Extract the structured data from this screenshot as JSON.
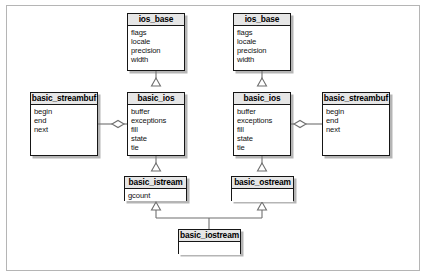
{
  "diagram": {
    "type": "uml-class-diagram",
    "background_color": "#ffffff",
    "frame_color": "#b5b5b5",
    "box_border_color": "#161616",
    "title_band_color": "#e6e6e6",
    "line_color": "#6f6f6f"
  },
  "classes": [
    {
      "id": "ios_base_left",
      "name": "ios_base",
      "attributes": [
        "flags",
        "locale",
        "precision",
        "width"
      ],
      "x": 127,
      "y": 13,
      "width": 58,
      "height": 58
    },
    {
      "id": "ios_base_right",
      "name": "ios_base",
      "attributes": [
        "flags",
        "locale",
        "precision",
        "width"
      ],
      "x": 233,
      "y": 13,
      "width": 58,
      "height": 58
    },
    {
      "id": "basic_streambuf_left",
      "name": "basic_streambuf",
      "attributes": [
        "begin",
        "end",
        "next"
      ],
      "x": 30,
      "y": 92,
      "width": 68,
      "height": 64
    },
    {
      "id": "basic_ios_left",
      "name": "basic_ios",
      "attributes": [
        "buffer",
        "exceptions",
        "fill",
        "state",
        "tie"
      ],
      "x": 127,
      "y": 92,
      "width": 58,
      "height": 64
    },
    {
      "id": "basic_ios_right",
      "name": "basic_ios",
      "attributes": [
        "buffer",
        "exceptions",
        "fill",
        "state",
        "tie"
      ],
      "x": 233,
      "y": 92,
      "width": 58,
      "height": 64
    },
    {
      "id": "basic_streambuf_right",
      "name": "basic_streambuf",
      "attributes": [
        "begin",
        "end",
        "next"
      ],
      "x": 322,
      "y": 92,
      "width": 68,
      "height": 64
    },
    {
      "id": "basic_istream",
      "name": "basic_istream",
      "attributes": [
        "gcount"
      ],
      "x": 124,
      "y": 176,
      "width": 63,
      "height": 25
    },
    {
      "id": "basic_ostream",
      "name": "basic_ostream",
      "attributes": [],
      "x": 231,
      "y": 176,
      "width": 63,
      "height": 25
    },
    {
      "id": "basic_iostream",
      "name": "basic_iostream",
      "attributes": [],
      "x": 178,
      "y": 229,
      "width": 63,
      "height": 25
    }
  ],
  "relationships": [
    {
      "type": "generalization",
      "from": "basic_ios_left",
      "to": "ios_base_left",
      "marker": "hollow-triangle"
    },
    {
      "type": "generalization",
      "from": "basic_ios_right",
      "to": "ios_base_right",
      "marker": "hollow-triangle"
    },
    {
      "type": "generalization",
      "from": "basic_istream",
      "to": "basic_ios_left",
      "marker": "hollow-triangle"
    },
    {
      "type": "generalization",
      "from": "basic_ostream",
      "to": "basic_ios_right",
      "marker": "hollow-triangle"
    },
    {
      "type": "generalization",
      "from": "basic_iostream",
      "to": "basic_istream",
      "marker": "hollow-triangle"
    },
    {
      "type": "generalization",
      "from": "basic_iostream",
      "to": "basic_ostream",
      "marker": "hollow-triangle"
    },
    {
      "type": "aggregation",
      "from": "basic_ios_left",
      "to": "basic_streambuf_left",
      "marker": "hollow-diamond"
    },
    {
      "type": "aggregation",
      "from": "basic_ios_right",
      "to": "basic_streambuf_right",
      "marker": "hollow-diamond"
    }
  ]
}
